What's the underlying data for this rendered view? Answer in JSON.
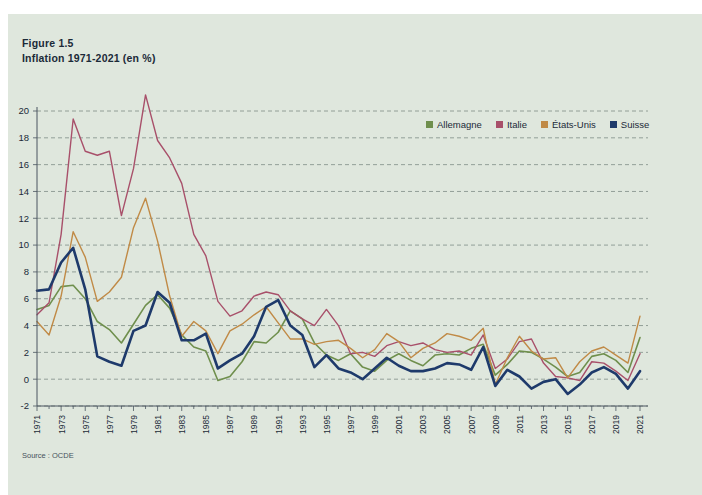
{
  "figure": {
    "label": "Figure 1.5",
    "subtitle": "Inflation 1971-2021 (en %)",
    "source": "Source : OCDE",
    "background_color": "#dfe7dd",
    "page_color": "#ffffff"
  },
  "legend": {
    "position": "top-right",
    "items": [
      {
        "label": "Allemagne",
        "color": "#6f8f4d"
      },
      {
        "label": "Italie",
        "color": "#a8506a"
      },
      {
        "label": "États-Unis",
        "color": "#c08a46"
      },
      {
        "label": "Suisse",
        "color": "#1e3a6b"
      }
    ]
  },
  "chart_data": {
    "type": "line",
    "title": "Inflation 1971-2021 (en %)",
    "subtitle": "Figure 1.5",
    "xlabel": "",
    "ylabel": "",
    "ylim": [
      -2,
      20
    ],
    "ytick_step": 2,
    "yticks": [
      -2,
      0,
      2,
      4,
      6,
      8,
      10,
      12,
      14,
      16,
      18,
      20
    ],
    "grid": true,
    "grid_style": "dashed-horizontal",
    "xlim": [
      1971,
      2021
    ],
    "x": [
      1971,
      1972,
      1973,
      1974,
      1975,
      1976,
      1977,
      1978,
      1979,
      1980,
      1981,
      1982,
      1983,
      1984,
      1985,
      1986,
      1987,
      1988,
      1989,
      1990,
      1991,
      1992,
      1993,
      1994,
      1995,
      1996,
      1997,
      1998,
      1999,
      2000,
      2001,
      2002,
      2003,
      2004,
      2005,
      2006,
      2007,
      2008,
      2009,
      2010,
      2011,
      2012,
      2013,
      2014,
      2015,
      2016,
      2017,
      2018,
      2019,
      2020,
      2021
    ],
    "xticks": [
      1971,
      1973,
      1975,
      1977,
      1979,
      1981,
      1983,
      1985,
      1987,
      1989,
      1991,
      1993,
      1995,
      1997,
      1999,
      2001,
      2003,
      2005,
      2007,
      2009,
      2011,
      2013,
      2015,
      2017,
      2019,
      2021
    ],
    "xtick_rotation": 90,
    "series": [
      {
        "name": "Allemagne",
        "color": "#6f8f4d",
        "width": 1.6,
        "values": [
          5.2,
          5.5,
          6.9,
          7.0,
          6.0,
          4.3,
          3.7,
          2.7,
          4.1,
          5.5,
          6.3,
          5.3,
          3.3,
          2.4,
          2.1,
          -0.1,
          0.2,
          1.3,
          2.8,
          2.7,
          3.5,
          5.1,
          4.5,
          2.7,
          1.8,
          1.4,
          1.9,
          0.9,
          0.6,
          1.4,
          1.9,
          1.4,
          1.0,
          1.8,
          1.9,
          1.8,
          2.3,
          2.6,
          0.3,
          1.1,
          2.1,
          2.0,
          1.5,
          0.9,
          0.2,
          0.5,
          1.7,
          1.9,
          1.4,
          0.5,
          3.1
        ]
      },
      {
        "name": "Italie",
        "color": "#a8506a",
        "width": 1.4,
        "values": [
          4.8,
          5.7,
          10.8,
          19.4,
          17.0,
          16.7,
          17.0,
          12.2,
          15.7,
          21.2,
          17.8,
          16.5,
          14.6,
          10.8,
          9.2,
          5.8,
          4.7,
          5.1,
          6.2,
          6.5,
          6.3,
          5.1,
          4.5,
          4.0,
          5.2,
          4.0,
          1.9,
          2.0,
          1.7,
          2.5,
          2.8,
          2.5,
          2.7,
          2.2,
          2.0,
          2.1,
          1.8,
          3.3,
          0.8,
          1.5,
          2.8,
          3.0,
          1.2,
          0.2,
          0.1,
          -0.1,
          1.3,
          1.2,
          0.6,
          -0.1,
          1.9
        ]
      },
      {
        "name": "États-Unis",
        "color": "#c08a46",
        "width": 1.4,
        "values": [
          4.3,
          3.3,
          6.2,
          11.0,
          9.1,
          5.8,
          6.5,
          7.6,
          11.3,
          13.5,
          10.3,
          6.2,
          3.2,
          4.3,
          3.6,
          1.9,
          3.6,
          4.1,
          4.8,
          5.4,
          4.2,
          3.0,
          3.0,
          2.6,
          2.8,
          2.9,
          2.3,
          1.6,
          2.2,
          3.4,
          2.8,
          1.6,
          2.3,
          2.7,
          3.4,
          3.2,
          2.9,
          3.8,
          -0.4,
          1.6,
          3.2,
          2.1,
          1.5,
          1.6,
          0.1,
          1.3,
          2.1,
          2.4,
          1.8,
          1.2,
          4.7
        ]
      },
      {
        "name": "Suisse",
        "color": "#1e3a6b",
        "width": 2.6,
        "values": [
          6.6,
          6.7,
          8.7,
          9.8,
          6.7,
          1.7,
          1.3,
          1.0,
          3.6,
          4.0,
          6.5,
          5.7,
          2.9,
          2.9,
          3.4,
          0.8,
          1.4,
          1.9,
          3.2,
          5.4,
          5.9,
          4.0,
          3.3,
          0.9,
          1.8,
          0.8,
          0.5,
          0.0,
          0.8,
          1.6,
          1.0,
          0.6,
          0.6,
          0.8,
          1.2,
          1.1,
          0.7,
          2.4,
          -0.5,
          0.7,
          0.2,
          -0.7,
          -0.2,
          0.0,
          -1.1,
          -0.4,
          0.5,
          0.9,
          0.4,
          -0.7,
          0.6
        ]
      }
    ]
  }
}
